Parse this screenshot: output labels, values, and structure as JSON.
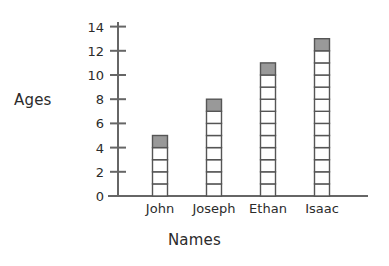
{
  "chart_data": {
    "type": "bar",
    "title": "",
    "subtitle": "",
    "xlabel": "Names",
    "ylabel": "Ages",
    "categories": [
      "John",
      "Joseph",
      "Ethan",
      "Isaac"
    ],
    "values": [
      5,
      8,
      11,
      13
    ],
    "series": [
      {
        "name": "Ages",
        "values": [
          5,
          8,
          11,
          13
        ]
      }
    ],
    "ylim": [
      0,
      14
    ],
    "y_ticks": [
      0,
      2,
      4,
      6,
      8,
      10,
      12,
      14
    ],
    "y_tick_labels": [
      "0",
      "2",
      "4",
      "6",
      "8",
      "10",
      "12",
      "14"
    ],
    "grid": false,
    "legend": false,
    "legend_position": "none",
    "annotations": [],
    "style": {
      "bar_style": "segmented-unit-stack",
      "unit_per_segment": 1,
      "top_segment_filled": true,
      "segment_fill_color": "#ffffff",
      "top_segment_color": "#999999",
      "segment_border_color": "#555555",
      "axis_color": "#666666",
      "background_color": "#ffffff",
      "text_color": "#2b2b2b"
    }
  },
  "axis": {
    "y_title": "Ages",
    "x_title": "Names"
  },
  "geometry": {
    "baseline_y": 196,
    "axis_x": 118,
    "axis_top_y": 22,
    "px_per_unit": 12.1,
    "bar_width": 15,
    "bar_centers": [
      160,
      214,
      268,
      322
    ]
  }
}
